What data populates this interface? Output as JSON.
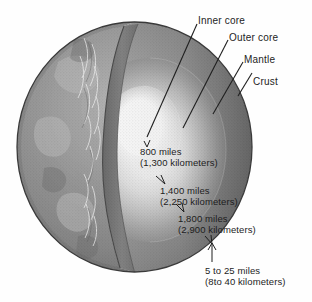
{
  "figure": {
    "background_color": "#fefefe",
    "ink_color": "#242424"
  },
  "globe": {
    "surface_color": "#8d8d8d",
    "cut_face_color": "#787878",
    "mantle_color": "#9a9a9a",
    "outer_core_color": "#c8c8c8",
    "inner_core_color": "#fdfdfd",
    "outline_color": "#3a3a3a"
  },
  "layer_labels": [
    {
      "name": "inner-core",
      "text": "Inner core"
    },
    {
      "name": "outer-core",
      "text": "Outer core"
    },
    {
      "name": "mantle",
      "text": "Mantle"
    },
    {
      "name": "crust",
      "text": "Crust"
    }
  ],
  "measurements": [
    {
      "name": "inner-core-depth",
      "miles": "800 miles",
      "kilometers": "(1,300 kilometers)"
    },
    {
      "name": "outer-core-depth",
      "miles": "1,400 miles",
      "kilometers": "(2,250 kilometers)"
    },
    {
      "name": "mantle-depth",
      "miles": "1,800 miles",
      "kilometers": "(2,900 kilometers)"
    },
    {
      "name": "crust-thickness",
      "miles": "5 to 25 miles",
      "kilometers": "(8to 40 kilometers)"
    }
  ]
}
